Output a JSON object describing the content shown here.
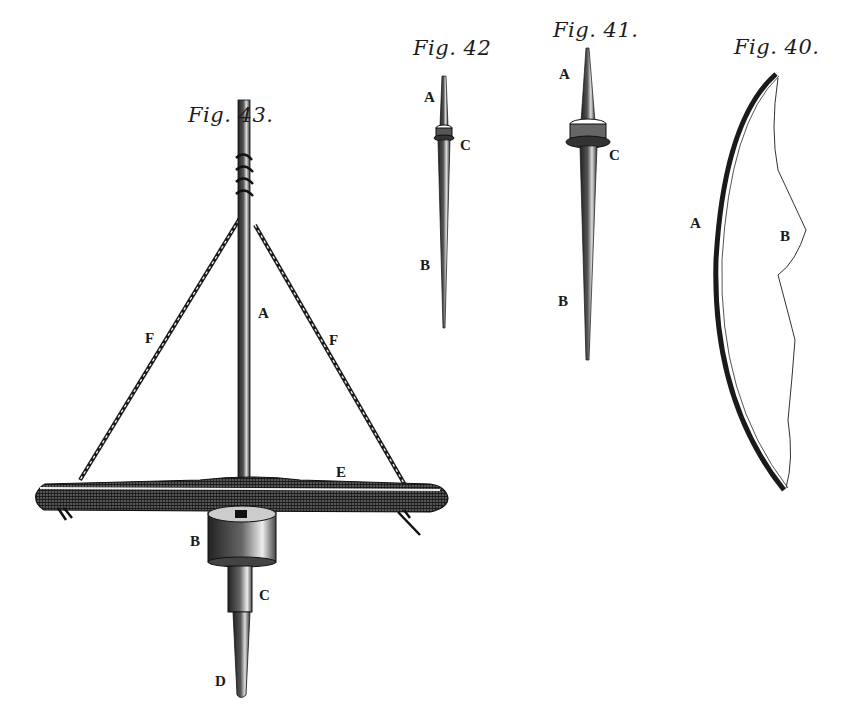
{
  "plate": {
    "type": "engraving",
    "colors": {
      "ink": "#1a1a1a",
      "paper": "#ffffff"
    }
  },
  "figures": [
    {
      "id": "fig43",
      "title": "Fig. 43.",
      "subject": "spindle with crossbar (pump drill style)",
      "labels": {
        "A": "A",
        "B": "B",
        "C": "C",
        "D": "D",
        "E": "E",
        "F_left": "F",
        "F_right": "F"
      }
    },
    {
      "id": "fig42",
      "title": "Fig. 42",
      "subject": "small spindle with whorl",
      "labels": {
        "A": "A",
        "C": "C",
        "B": "B"
      }
    },
    {
      "id": "fig41",
      "title": "Fig. 41.",
      "subject": "larger spindle with whorl",
      "labels": {
        "A": "A",
        "C": "C",
        "B": "B"
      }
    },
    {
      "id": "fig40",
      "title": "Fig. 40.",
      "subject": "bow with string",
      "labels": {
        "A": "A",
        "B": "B"
      }
    }
  ]
}
